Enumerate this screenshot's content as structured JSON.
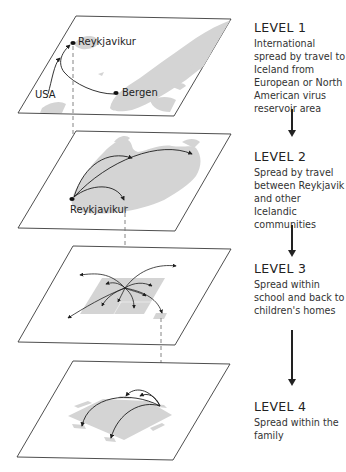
{
  "colors": {
    "plane_outline": "#3a3a3a",
    "land": "#d4d4d4",
    "connector": "#777777",
    "arrow": "#1e1e1e"
  },
  "levels": [
    {
      "title": "LEVEL 1",
      "description": "International spread by travel to Iceland from European or North American virus reservoir area",
      "map_labels": [
        "Reykjavikur",
        "USA",
        "Bergen"
      ]
    },
    {
      "title": "LEVEL 2",
      "description": "Spread by travel between Reykjavik and other Icelandic communities",
      "map_labels": [
        "Reykjavikur"
      ]
    },
    {
      "title": "LEVEL 3",
      "description": "Spread within school and back to children's homes",
      "map_labels": []
    },
    {
      "title": "LEVEL 4",
      "description": "Spread within the family",
      "map_labels": []
    }
  ]
}
